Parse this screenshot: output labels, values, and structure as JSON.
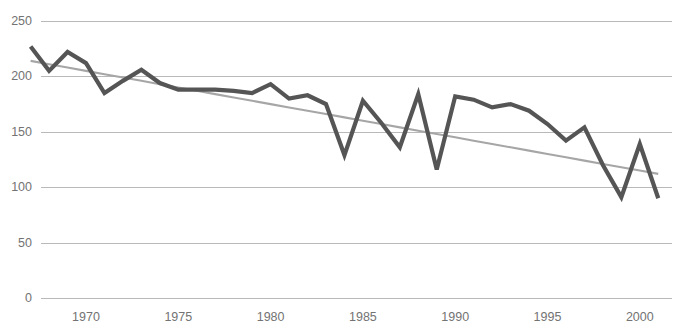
{
  "chart_data": {
    "type": "line",
    "title": "",
    "xlabel": "",
    "ylabel": "",
    "xlim": [
      1967,
      2003
    ],
    "ylim": [
      0,
      250
    ],
    "grid": true,
    "legend": false,
    "x_ticks": [
      1970,
      1975,
      1980,
      1985,
      1990,
      1995,
      2000
    ],
    "y_ticks": [
      0,
      50,
      100,
      150,
      200,
      250
    ],
    "x": [
      1967,
      1968,
      1969,
      1970,
      1971,
      1972,
      1973,
      1974,
      1975,
      1976,
      1977,
      1978,
      1979,
      1980,
      1981,
      1982,
      1983,
      1984,
      1985,
      1986,
      1987,
      1988,
      1989,
      1990,
      1991,
      1992,
      1993,
      1994,
      1995,
      1996,
      1997,
      1998,
      1999,
      2000,
      2001
    ],
    "series": [
      {
        "name": "Observed series",
        "color": "#555555",
        "style": "solid",
        "values": [
          227,
          205,
          222,
          212,
          185,
          196,
          206,
          194,
          188,
          188,
          188,
          187,
          185,
          193,
          180,
          183,
          175,
          129,
          178,
          158,
          136,
          184,
          116,
          182,
          179,
          172,
          175,
          169,
          157,
          142,
          154,
          120,
          91,
          139,
          90
        ]
      },
      {
        "name": "Linear trend",
        "color": "#a6a6a6",
        "style": "solid",
        "values": [
          214,
          211,
          208,
          205,
          202,
          199,
          196,
          193,
          190,
          187,
          184,
          181,
          178,
          175,
          172,
          169,
          166,
          163,
          160,
          157,
          154,
          151,
          148,
          145,
          142,
          139,
          136,
          133,
          130,
          127,
          124,
          121,
          118,
          115,
          112
        ]
      }
    ]
  },
  "colors": {
    "series": "#555555",
    "trend": "#a6a6a6",
    "grid": "#b9b9b9",
    "tick_text": "#737373",
    "background": "#ffffff"
  }
}
